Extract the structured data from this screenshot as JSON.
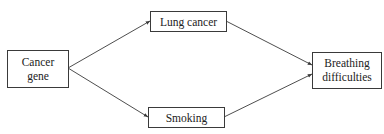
{
  "diagram": {
    "type": "causal-dag",
    "nodes": [
      {
        "id": "cancer_gene",
        "lines": [
          "Cancer",
          "gene"
        ]
      },
      {
        "id": "lung_cancer",
        "lines": [
          "Lung cancer"
        ]
      },
      {
        "id": "smoking",
        "lines": [
          "Smoking"
        ]
      },
      {
        "id": "breathing",
        "lines": [
          "Breathing",
          "difficulties"
        ]
      }
    ],
    "edges": [
      {
        "from": "cancer_gene",
        "to": "lung_cancer"
      },
      {
        "from": "cancer_gene",
        "to": "smoking"
      },
      {
        "from": "lung_cancer",
        "to": "breathing"
      },
      {
        "from": "smoking",
        "to": "breathing"
      }
    ],
    "colors": {
      "stroke": "#3a3a3a",
      "text": "#222222",
      "background": "#ffffff"
    }
  }
}
